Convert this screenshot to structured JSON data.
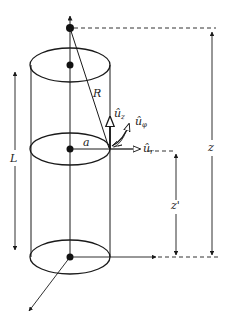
{
  "diagram": {
    "type": "cylinder-field-geometry",
    "labels": {
      "radius_distance": "R",
      "cylinder_radius": "a",
      "length": "L",
      "height_z": "z",
      "height_z_prime": "z'",
      "unit_z": "û",
      "unit_z_sub": "z",
      "unit_phi": "û",
      "unit_phi_sub": "φ",
      "unit_r": "û",
      "unit_r_sub": "r"
    },
    "colors": {
      "stroke": "#1a1a1a",
      "background": "#ffffff",
      "dashed": "#333333"
    }
  }
}
